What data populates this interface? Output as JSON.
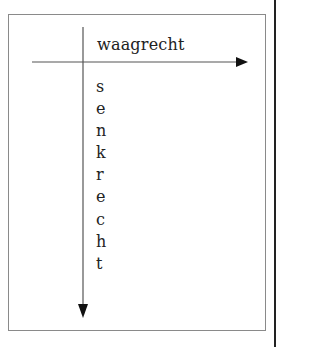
{
  "diagram": {
    "horizontal_label": "waagrecht",
    "vertical_label": "senkrecht",
    "vertical_letters": [
      "s",
      "e",
      "n",
      "k",
      "r",
      "e",
      "c",
      "h",
      "t"
    ],
    "colors": {
      "frame": "#8a8a8a",
      "lines": "#444444",
      "text": "#222222",
      "page_edge": "#222222"
    }
  }
}
